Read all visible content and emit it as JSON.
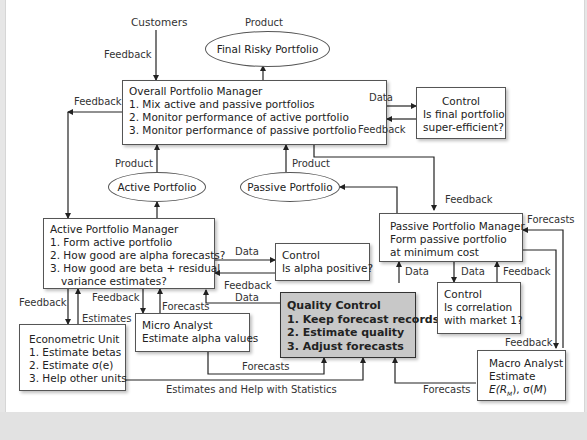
{
  "diagram": {
    "nodes": {
      "customers": "Customers",
      "final_risky_portfolio": "Final Risky Portfolio",
      "overall_manager": {
        "title": "Overall Portfolio Manager",
        "items": [
          "1. Mix active and passive portfolios",
          "2. Monitor performance of active portfolio",
          "3. Monitor performance of passive portfolio"
        ]
      },
      "control_final": {
        "title": "Control",
        "lines": [
          "Is final portfolio",
          "super-efficient?"
        ]
      },
      "active_portfolio": "Active Portfolio",
      "passive_portfolio": "Passive Portfolio",
      "active_manager": {
        "title": "Active Portfolio Manager",
        "items": [
          "1. Form active portfolio",
          "2. How good are alpha forecasts?",
          "3. How good are beta + residual",
          "variance estimates?"
        ]
      },
      "control_alpha": {
        "title": "Control",
        "lines": [
          "Is alpha positive?"
        ]
      },
      "passive_manager": {
        "title": "Passive Portfolio Manager",
        "lines": [
          "Form passive portfolio",
          "at minimum  cost"
        ]
      },
      "control_corr": {
        "title": "Control",
        "lines": [
          "Is correlation",
          "with market 1?"
        ]
      },
      "quality_control": {
        "title": "Quality Control",
        "items": [
          "1. Keep forecast records",
          "2. Estimate quality",
          "3. Adjust forecasts"
        ]
      },
      "micro_analyst": {
        "title": "Micro Analyst",
        "lines": [
          "Estimate alpha values"
        ]
      },
      "econometric_unit": {
        "title": "Econometric Unit",
        "items": [
          "1. Estimate betas",
          "2. Estimate σ(e)",
          "3. Help other units"
        ]
      },
      "macro_analyst": {
        "title": "Macro Analyst",
        "lines": [
          "Estimate"
        ],
        "formula_a": "E(R",
        "formula_sub": "M",
        "formula_b": "), σ(",
        "formula_c": "M",
        "formula_d": ")"
      }
    },
    "edge_labels": {
      "feedback_customers": "Feedback",
      "product_final": "Product",
      "feedback_left": "Feedback",
      "data_overall_control": "Data",
      "feedback_control_overall": "Feedback",
      "product_active": "Product",
      "product_passive": "Product",
      "feedback_passive_top": "Feedback",
      "forecasts_passive_right": "Forecasts",
      "data_active_control": "Data",
      "feedback_control_active": "Feedback",
      "data_qc_active": "Data",
      "data_qc_passive": "Data",
      "data_passive_control": "Data",
      "feedback_control_passive": "Feedback",
      "feedback_econ": "Feedback",
      "estimates_econ": "Estimates",
      "feedback_micro": "Feedback",
      "forecasts_micro": "Forecasts",
      "forecasts_micro_qc": "Forecasts",
      "estimates_help": "Estimates and Help with Statistics",
      "feedback_macro": "Feedback",
      "forecasts_macro_qc": "Forecasts"
    }
  }
}
